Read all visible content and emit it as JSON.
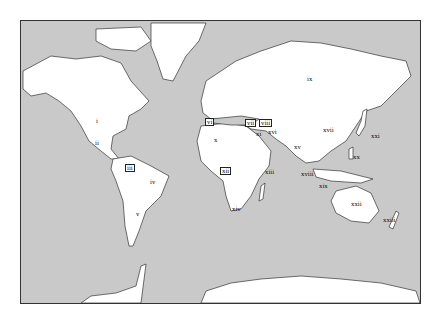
{
  "map": {
    "colors": {
      "ocean": "#c9c9c9",
      "land": "#ffffff",
      "border": "#333333",
      "shaded_land": "#c9c9c9"
    },
    "labels": [
      {
        "id": "i",
        "text": "i",
        "x": 95,
        "y": 117
      },
      {
        "id": "ii",
        "text": "ii",
        "x": 94,
        "y": 139
      },
      {
        "id": "iii",
        "text": "iii",
        "x": 124,
        "y": 163
      },
      {
        "id": "iv",
        "text": "iv",
        "x": 149,
        "y": 178
      },
      {
        "id": "v",
        "text": "v",
        "x": 135,
        "y": 210
      },
      {
        "id": "vi",
        "text": "vi",
        "x": 204,
        "y": 117
      },
      {
        "id": "vii",
        "text": "vii",
        "x": 244,
        "y": 118
      },
      {
        "id": "viii",
        "text": "viii",
        "x": 258,
        "y": 118
      },
      {
        "id": "ix",
        "text": "ix",
        "x": 306,
        "y": 75
      },
      {
        "id": "x",
        "text": "x",
        "x": 213,
        "y": 136
      },
      {
        "id": "xi",
        "text": "xi",
        "x": 255,
        "y": 130
      },
      {
        "id": "xii",
        "text": "xii",
        "x": 219,
        "y": 166
      },
      {
        "id": "xiii",
        "text": "xiii",
        "x": 264,
        "y": 168
      },
      {
        "id": "xiv",
        "text": "xiv",
        "x": 231,
        "y": 205
      },
      {
        "id": "xv",
        "text": "xv",
        "x": 293,
        "y": 143
      },
      {
        "id": "xvi",
        "text": "xvi",
        "x": 267,
        "y": 128
      },
      {
        "id": "xvii",
        "text": "xvii",
        "x": 322,
        "y": 126
      },
      {
        "id": "xviii",
        "text": "xviii",
        "x": 300,
        "y": 170
      },
      {
        "id": "xix",
        "text": "xix",
        "x": 318,
        "y": 182
      },
      {
        "id": "xx",
        "text": "xx",
        "x": 352,
        "y": 153
      },
      {
        "id": "xxi",
        "text": "xxi",
        "x": 370,
        "y": 132
      },
      {
        "id": "xxii",
        "text": "xxii",
        "x": 350,
        "y": 200
      },
      {
        "id": "xxiii",
        "text": "xxiii",
        "x": 382,
        "y": 216
      }
    ]
  }
}
